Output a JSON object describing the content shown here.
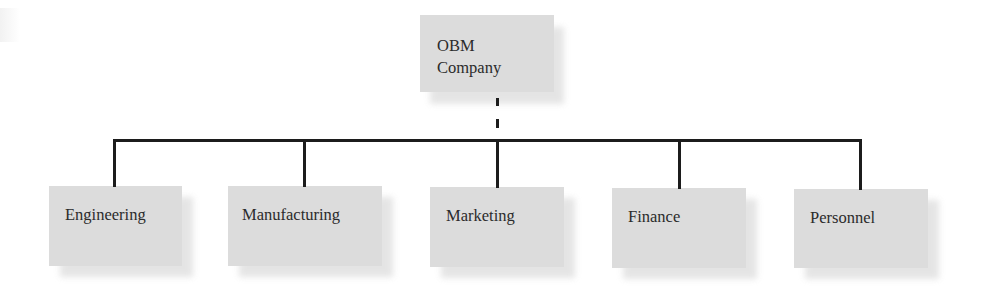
{
  "diagram": {
    "type": "org-chart",
    "root": {
      "label_line1": "OBM",
      "label_line2": "Company"
    },
    "children": [
      {
        "label": "Engineering"
      },
      {
        "label": "Manufacturing"
      },
      {
        "label": "Marketing"
      },
      {
        "label": "Finance"
      },
      {
        "label": "Personnel"
      }
    ],
    "connector_style": {
      "root_to_bus": "dashed",
      "bus_to_children": "solid"
    },
    "colors": {
      "box_fill": "#dcdcdc",
      "box_shadow": "#cfcfcf",
      "text": "#2b2b2b",
      "lines": "#1c1c1c",
      "background": "#ffffff"
    }
  }
}
